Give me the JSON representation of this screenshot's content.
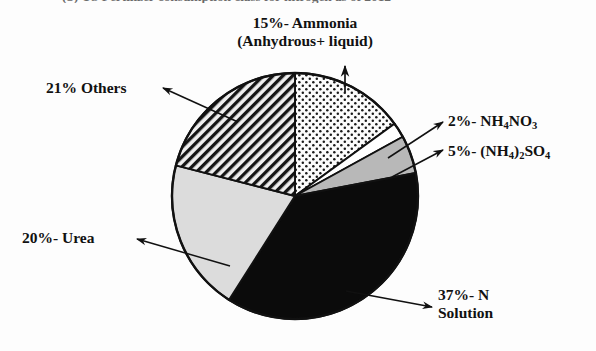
{
  "figure": {
    "cropped_title": "(b) US Fertilizer consumption class for nitrogen as of 2012",
    "background_color": "#fdfdfd",
    "outline_color": "#111111"
  },
  "chart_data": {
    "type": "pie",
    "title": "",
    "xlabel": "",
    "ylabel": "",
    "grid": false,
    "legend_position": "none",
    "start_angle_deg": 0,
    "direction": "clockwise",
    "center": {
      "x": 295,
      "y": 196
    },
    "radius": 123,
    "categories": [
      "Ammonia (Anhydrous+ liquid)",
      "NH4NO3",
      "(NH4)2SO4",
      "N Solution",
      "Urea",
      "Others"
    ],
    "values": [
      15,
      2,
      5,
      37,
      20,
      21
    ],
    "unit": "%",
    "slices": [
      {
        "key": "ammonia",
        "percent": 15,
        "percent_text": "15%",
        "label_line1": "15%- Ammonia",
        "label_line2": "(Anhydrous+ liquid)",
        "fill_pattern": "dots",
        "fill_color": "#fbfbfb",
        "start_deg": 0.0,
        "end_deg": 54.0
      },
      {
        "key": "nh4no3",
        "percent": 2,
        "percent_text": "2%",
        "label_prefix": "2%- NH",
        "label_sub1": "4",
        "label_mid": "NO",
        "label_sub2": "3",
        "fill_pattern": "solid-white",
        "fill_color": "#ffffff",
        "start_deg": 54.0,
        "end_deg": 61.2
      },
      {
        "key": "nh42so4",
        "percent": 5,
        "percent_text": "5%",
        "label_prefix": "5%- (NH",
        "label_sub1": "4",
        "label_mid": ")",
        "label_sub2": "2",
        "label_mid2": "SO",
        "label_sub3": "4",
        "fill_pattern": "solid-gray",
        "fill_color": "#b8b8b8",
        "start_deg": 61.2,
        "end_deg": 79.2
      },
      {
        "key": "nsolution",
        "percent": 37,
        "percent_text": "37%",
        "label_line1": "37%- N",
        "label_line2": "Solution",
        "fill_pattern": "solid-black",
        "fill_color": "#0b0b0b",
        "start_deg": 79.2,
        "end_deg": 212.4
      },
      {
        "key": "urea",
        "percent": 20,
        "percent_text": "20%",
        "label_line1": "20%- Urea",
        "fill_pattern": "solid-lightgray",
        "fill_color": "#dcdcdc",
        "start_deg": 212.4,
        "end_deg": 284.4
      },
      {
        "key": "others",
        "percent": 21,
        "percent_text": "21%",
        "label_line1": "21% Others",
        "fill_pattern": "diagonal-hatch",
        "fill_color": "#e8e8e8",
        "start_deg": 284.4,
        "end_deg": 360.0
      }
    ]
  },
  "labels": {
    "ammonia_line1": "15%- Ammonia",
    "ammonia_line2": "(Anhydrous+ liquid)",
    "others": "21% Others",
    "nh4no3_pre": "2%- NH",
    "nh4no3_sub1": "4",
    "nh4no3_mid": "NO",
    "nh4no3_sub2": "3",
    "nh42so4_pre": "5%- (NH",
    "nh42so4_sub1": "4",
    "nh42so4_mid": ")",
    "nh42so4_sub2": "2",
    "nh42so4_mid2": "SO",
    "nh42so4_sub3": "4",
    "urea": "20%- Urea",
    "nsolution_line1": "37%- N",
    "nsolution_line2": "Solution"
  }
}
